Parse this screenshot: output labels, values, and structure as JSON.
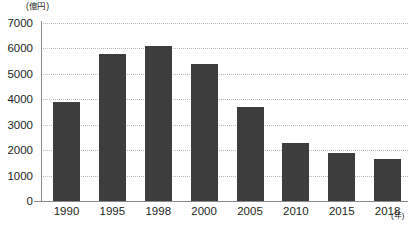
{
  "chart_data": {
    "type": "bar",
    "title": "",
    "subtitle": "",
    "xlabel": "(年)",
    "ylabel": "(億円)",
    "categories": [
      "1990",
      "1995",
      "1998",
      "2000",
      "2005",
      "2010",
      "2015",
      "2018"
    ],
    "values": [
      3900,
      5800,
      6100,
      5400,
      3700,
      2300,
      1900,
      1650
    ],
    "series": [
      {
        "name": "",
        "values": [
          3900,
          5800,
          6100,
          5400,
          3700,
          2300,
          1900,
          1650
        ]
      }
    ],
    "ylim": [
      0,
      7000
    ],
    "ytick_labels": [
      "0",
      "1000",
      "2000",
      "3000",
      "4000",
      "5000",
      "6000",
      "7000"
    ],
    "ytick_values": [
      0,
      1000,
      2000,
      3000,
      4000,
      5000,
      6000,
      7000
    ],
    "grid": true,
    "grid_axis": "y",
    "legend": false,
    "legend_position": "none",
    "bar_color": "#3d3d3d",
    "grid_color": "#b9b9b9",
    "axis_color": "#8a8a8a",
    "background_color": "#ffffff",
    "annotations": []
  }
}
